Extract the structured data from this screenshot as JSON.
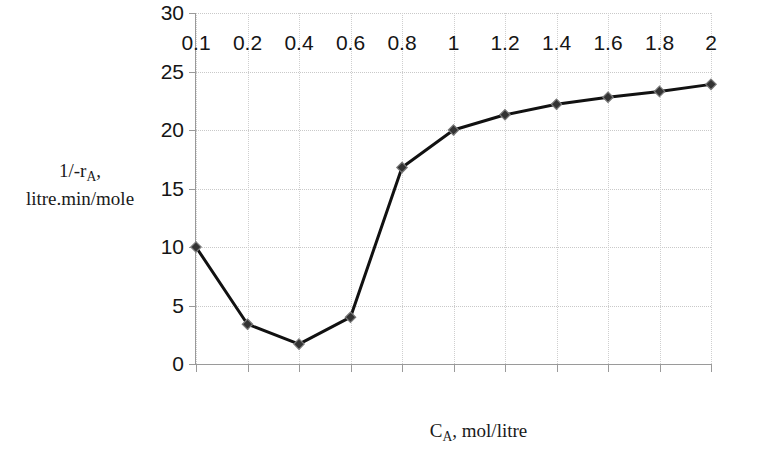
{
  "chart_data": {
    "type": "line",
    "title": "",
    "subtitle": "",
    "xlabel": "C_A, mol/litre",
    "xlabel_parts": {
      "main": "C",
      "subscript": "A",
      "rest": ", mol/litre"
    },
    "ylabel": "1/-r_A, litre.min/mole",
    "ylabel_line1_parts": {
      "main": "1/-r",
      "subscript": "A",
      "rest": ","
    },
    "ylabel_line2": "litre.min/mole",
    "categories": [
      "0.1",
      "0.2",
      "0.4",
      "0.6",
      "0.8",
      "1",
      "1.2",
      "1.4",
      "1.6",
      "1.8",
      "2"
    ],
    "x": [
      0.1,
      0.2,
      0.4,
      0.6,
      0.8,
      1,
      1.2,
      1.4,
      1.6,
      1.8,
      2
    ],
    "values": [
      10.0,
      3.4,
      1.7,
      4.0,
      16.8,
      20.0,
      21.3,
      22.2,
      22.8,
      23.3,
      23.9
    ],
    "series": [
      {
        "name": "1/-rA",
        "values": [
          10.0,
          3.4,
          1.7,
          4.0,
          16.8,
          20.0,
          21.3,
          22.2,
          22.8,
          23.3,
          23.9
        ]
      }
    ],
    "yticks": [
      0,
      5,
      10,
      15,
      20,
      25,
      30
    ],
    "ytick_labels": [
      "0",
      "5",
      "10",
      "15",
      "20",
      "25",
      "30"
    ],
    "ylim": [
      0,
      30
    ],
    "xlim_index": [
      0,
      10
    ],
    "grid": true,
    "grid_style": "dotted",
    "legend": false,
    "legend_position": "none",
    "line_color": "#111111",
    "marker_color": "#333333",
    "marker_shape": "diamond",
    "line_width": 3,
    "axis_color": "#9a9a9a",
    "background": "#ffffff"
  }
}
